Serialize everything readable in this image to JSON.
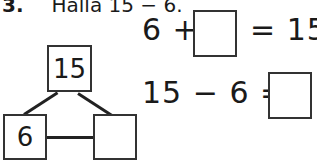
{
  "problem": {
    "number": "3.",
    "instruction": "Halla 15 − 6."
  },
  "number_bond": {
    "whole": "15",
    "part_known": "6",
    "part_unknown": ""
  },
  "equations": [
    {
      "left": "6 +",
      "blank": "",
      "right": "= 15"
    },
    {
      "left": "15 − 6 =",
      "blank": ""
    }
  ],
  "colors": {
    "ink": "#1a1a1a",
    "border": "#333333",
    "background": "#ffffff"
  }
}
